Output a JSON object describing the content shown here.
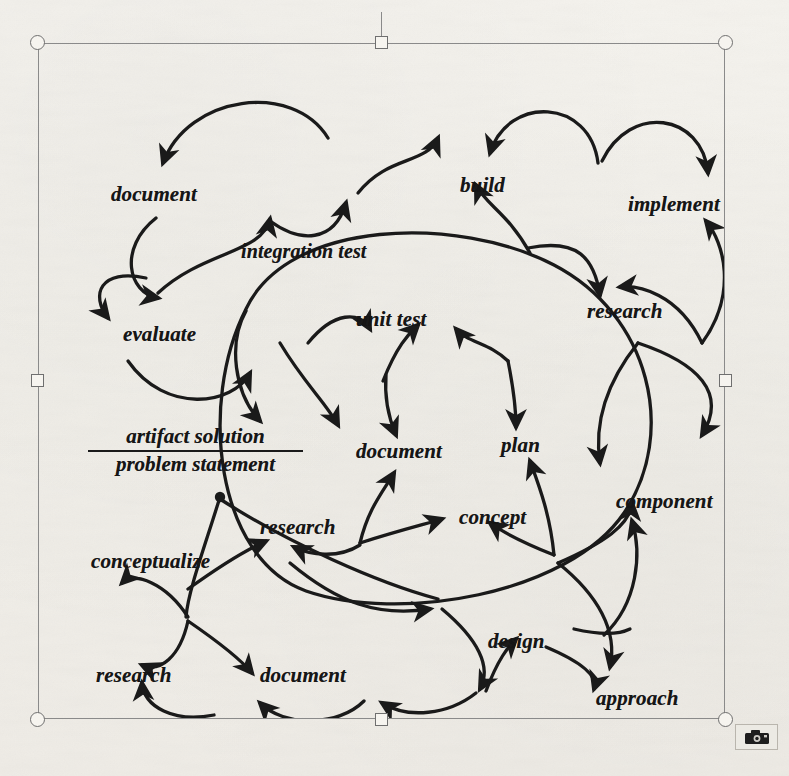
{
  "app": {
    "context": "scanned figure selected inside a document editor",
    "selection_frame": {
      "name": "image-selection-frame",
      "handle_color": "#6f6f6f",
      "border_color": "#8a8a8a",
      "handles": [
        {
          "id": "top-left",
          "shape": "circle"
        },
        {
          "id": "top-center",
          "shape": "square"
        },
        {
          "id": "top-right",
          "shape": "circle"
        },
        {
          "id": "middle-left",
          "shape": "square"
        },
        {
          "id": "middle-right",
          "shape": "square"
        },
        {
          "id": "bottom-left",
          "shape": "circle"
        },
        {
          "id": "bottom-center",
          "shape": "square"
        },
        {
          "id": "bottom-right",
          "shape": "circle"
        }
      ],
      "rotation_handle": true
    },
    "picture_toolbar": {
      "icon": "picture-toolbar-icon",
      "label": ""
    }
  },
  "diagram": {
    "title": "",
    "type": "process-cycle-scribble",
    "ink_color": "#1a1a1a",
    "origin_marker": {
      "name": "start-dot",
      "x": 182,
      "y": 454
    },
    "fraction_label": {
      "numerator": "artifact solution",
      "denominator": "problem statement"
    },
    "labels": [
      {
        "id": "document-top-left",
        "text": "document",
        "x": 73,
        "y": 141,
        "size": 21
      },
      {
        "id": "integration-test",
        "text": "integration test",
        "x": 203,
        "y": 198,
        "size": 20
      },
      {
        "id": "build",
        "text": "build",
        "x": 422,
        "y": 132,
        "size": 21
      },
      {
        "id": "implement",
        "text": "implement",
        "x": 590,
        "y": 151,
        "size": 21
      },
      {
        "id": "evaluate",
        "text": "evaluate",
        "x": 85,
        "y": 281,
        "size": 21
      },
      {
        "id": "unit-test",
        "text": "unit test",
        "x": 318,
        "y": 266,
        "size": 21
      },
      {
        "id": "research-right-upper",
        "text": "research",
        "x": 549,
        "y": 258,
        "size": 21
      },
      {
        "id": "document-center",
        "text": "document",
        "x": 318,
        "y": 398,
        "size": 21
      },
      {
        "id": "plan",
        "text": "plan",
        "x": 463,
        "y": 392,
        "size": 21
      },
      {
        "id": "component",
        "text": "component",
        "x": 578,
        "y": 448,
        "size": 21
      },
      {
        "id": "research-center",
        "text": "research",
        "x": 222,
        "y": 474,
        "size": 21
      },
      {
        "id": "concept",
        "text": "concept",
        "x": 421,
        "y": 464,
        "size": 21
      },
      {
        "id": "conceptualize",
        "text": "conceptualize",
        "x": 53,
        "y": 508,
        "size": 21
      },
      {
        "id": "design",
        "text": "design",
        "x": 450,
        "y": 588,
        "size": 21
      },
      {
        "id": "research-bottom-left",
        "text": "research",
        "x": 58,
        "y": 622,
        "size": 21
      },
      {
        "id": "document-bottom",
        "text": "document",
        "x": 222,
        "y": 622,
        "size": 21
      },
      {
        "id": "approach",
        "text": "approach",
        "x": 558,
        "y": 645,
        "size": 21
      }
    ]
  }
}
